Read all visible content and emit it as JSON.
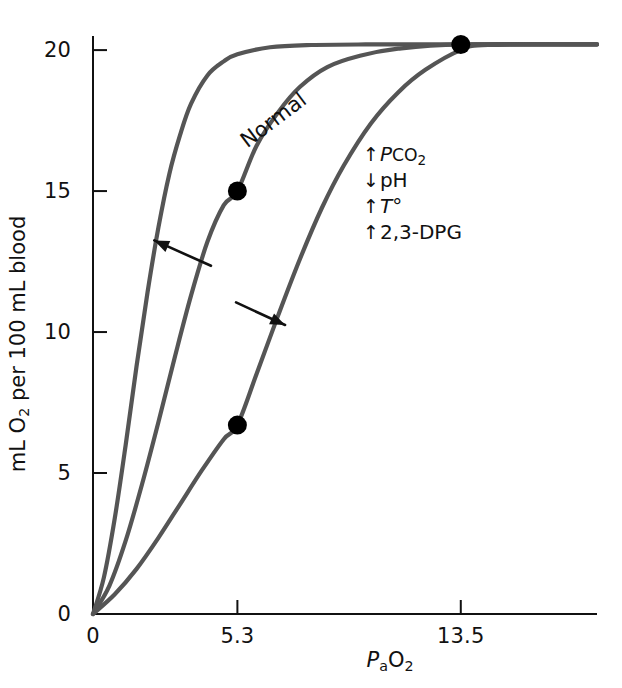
{
  "chart_data": {
    "type": "line",
    "title": "",
    "subtitle": "",
    "xlabel": "PaO2",
    "ylabel": "mL O2 per 100 mL blood",
    "xlim": [
      0,
      18.5
    ],
    "ylim": [
      0,
      20.5
    ],
    "grid": false,
    "legend": "none",
    "x_ticks": [
      {
        "value": 0,
        "label": "0"
      },
      {
        "value": 5.3,
        "label": "5.3"
      },
      {
        "value": 13.5,
        "label": "13.5"
      }
    ],
    "y_ticks": [
      {
        "value": 0,
        "label": "0"
      },
      {
        "value": 5,
        "label": "5"
      },
      {
        "value": 10,
        "label": "10"
      },
      {
        "value": 15,
        "label": "15"
      },
      {
        "value": 20,
        "label": "20"
      }
    ],
    "series": [
      {
        "name": "Left-shifted curve",
        "color": "#555555",
        "points": [
          [
            0.0,
            0.0
          ],
          [
            0.4,
            1.3
          ],
          [
            0.8,
            3.4
          ],
          [
            1.2,
            6.0
          ],
          [
            1.6,
            8.8
          ],
          [
            2.0,
            11.4
          ],
          [
            2.4,
            13.7
          ],
          [
            2.8,
            15.6
          ],
          [
            3.2,
            17.0
          ],
          [
            3.6,
            18.1
          ],
          [
            4.2,
            19.1
          ],
          [
            4.8,
            19.6
          ],
          [
            5.3,
            19.85
          ],
          [
            6.5,
            20.1
          ],
          [
            8.0,
            20.18
          ],
          [
            10.0,
            20.2
          ],
          [
            13.5,
            20.2
          ],
          [
            18.5,
            20.2
          ]
        ]
      },
      {
        "name": "Normal",
        "color": "#555555",
        "points": [
          [
            0.0,
            0.0
          ],
          [
            0.6,
            1.0
          ],
          [
            1.2,
            2.6
          ],
          [
            1.8,
            4.6
          ],
          [
            2.4,
            6.8
          ],
          [
            3.0,
            9.1
          ],
          [
            3.6,
            11.3
          ],
          [
            4.2,
            13.2
          ],
          [
            4.8,
            14.5
          ],
          [
            5.3,
            15.0
          ],
          [
            6.0,
            16.6
          ],
          [
            6.8,
            17.8
          ],
          [
            7.6,
            18.7
          ],
          [
            8.6,
            19.4
          ],
          [
            9.8,
            19.8
          ],
          [
            11.2,
            20.05
          ],
          [
            13.5,
            20.2
          ],
          [
            18.5,
            20.2
          ]
        ]
      },
      {
        "name": "Right-shifted curve",
        "color": "#555555",
        "points": [
          [
            0.0,
            0.0
          ],
          [
            0.8,
            0.7
          ],
          [
            1.6,
            1.6
          ],
          [
            2.4,
            2.7
          ],
          [
            3.2,
            3.9
          ],
          [
            4.0,
            5.1
          ],
          [
            4.8,
            6.2
          ],
          [
            5.3,
            6.7
          ],
          [
            6.0,
            8.5
          ],
          [
            6.8,
            10.6
          ],
          [
            7.6,
            12.6
          ],
          [
            8.4,
            14.4
          ],
          [
            9.2,
            15.9
          ],
          [
            10.2,
            17.4
          ],
          [
            11.2,
            18.5
          ],
          [
            12.2,
            19.3
          ],
          [
            13.5,
            20.0
          ],
          [
            14.5,
            20.18
          ],
          [
            18.5,
            20.2
          ]
        ]
      }
    ],
    "markers": [
      {
        "name": "arterial-point",
        "x": 13.5,
        "y": 20.2,
        "color": "#000000"
      },
      {
        "name": "normal-venous-point",
        "x": 5.3,
        "y": 15.0,
        "color": "#000000"
      },
      {
        "name": "right-shift-venous-point",
        "x": 5.3,
        "y": 6.7,
        "color": "#000000"
      }
    ],
    "arrows": [
      {
        "name": "left-shift-arrow",
        "from": [
          4.33,
          12.35
        ],
        "to": [
          2.25,
          13.25
        ],
        "direction": "up-left"
      },
      {
        "name": "right-shift-arrow",
        "from": [
          5.25,
          11.05
        ],
        "to": [
          7.05,
          10.25
        ],
        "direction": "down-right"
      }
    ],
    "annotations": [
      {
        "name": "normal-curve-label",
        "text": "Normal",
        "x": 5.0,
        "y": 16.75,
        "rotation": -37
      },
      {
        "name": "shift-factors-note",
        "lines": [
          "↑PCO2",
          "↓pH",
          "↑T°",
          "↑2,3-DPG"
        ],
        "x": 9.2,
        "y": 16.5
      }
    ]
  },
  "axes": {
    "y_title": {
      "prefix": "mL O",
      "sub": "2",
      "suffix": " per 100 mL blood"
    },
    "x_title": {
      "p": "P",
      "sub_a": "a",
      "o": "O",
      "sub_2": "2"
    },
    "x_tick_labels": [
      "0",
      "5.3",
      "13.5"
    ],
    "y_tick_labels": [
      "0",
      "5",
      "10",
      "15",
      "20"
    ]
  },
  "labels": {
    "normal_curve": "Normal"
  },
  "shift_note": {
    "line1": {
      "arrow": "↑",
      "p": "P",
      "co": "CO",
      "sub": "2"
    },
    "line2": {
      "arrow": "↓",
      "text": "pH"
    },
    "line3": {
      "arrow": "↑",
      "t": "T",
      "deg": "°"
    },
    "line4": {
      "arrow": "↑",
      "text": "2,3-DPG"
    }
  },
  "colors": {
    "curve": "#555555",
    "axis": "#111111",
    "marker": "#000000",
    "background": "#ffffff"
  }
}
